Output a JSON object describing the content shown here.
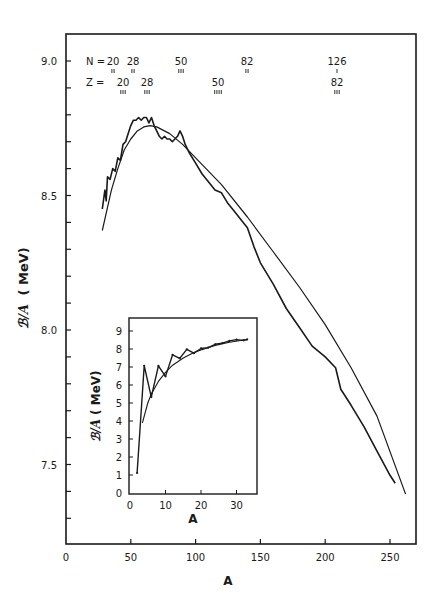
{
  "chart_data": [
    {
      "type": "line",
      "title": "",
      "xlabel": "A",
      "ylabel": "B/A (MeV)",
      "xlim": [
        0,
        270
      ],
      "ylim": [
        7.2,
        9.1
      ],
      "xticks": [
        0,
        50,
        100,
        150,
        200,
        250
      ],
      "yticks": [
        7.5,
        8.0,
        8.5,
        9.0
      ],
      "grid": false,
      "legend": null,
      "series": [
        {
          "name": "measured (jagged)",
          "x": [
            28,
            30,
            31,
            32,
            34,
            36,
            38,
            40,
            42,
            44,
            46,
            48,
            50,
            52,
            54,
            56,
            58,
            60,
            62,
            64,
            66,
            68,
            70,
            72,
            74,
            76,
            78,
            80,
            82,
            84,
            86,
            88,
            90,
            92,
            95,
            100,
            105,
            110,
            115,
            120,
            125,
            130,
            135,
            140,
            145,
            150,
            160,
            170,
            180,
            190,
            200,
            208,
            212,
            220,
            230,
            240,
            250,
            254
          ],
          "y": [
            8.45,
            8.52,
            8.48,
            8.57,
            8.56,
            8.6,
            8.59,
            8.64,
            8.63,
            8.69,
            8.7,
            8.73,
            8.76,
            8.78,
            8.78,
            8.79,
            8.78,
            8.79,
            8.79,
            8.77,
            8.79,
            8.76,
            8.74,
            8.72,
            8.71,
            8.72,
            8.71,
            8.71,
            8.7,
            8.71,
            8.72,
            8.74,
            8.72,
            8.69,
            8.66,
            8.62,
            8.58,
            8.55,
            8.52,
            8.51,
            8.47,
            8.44,
            8.41,
            8.38,
            8.31,
            8.25,
            8.17,
            8.08,
            8.01,
            7.94,
            7.9,
            7.86,
            7.78,
            7.72,
            7.64,
            7.55,
            7.46,
            7.43
          ]
        },
        {
          "name": "semi-empirical fit (smooth)",
          "x": [
            28,
            35,
            40,
            45,
            50,
            55,
            60,
            65,
            70,
            80,
            90,
            100,
            120,
            140,
            160,
            180,
            200,
            220,
            240,
            262
          ],
          "y": [
            8.37,
            8.52,
            8.6,
            8.67,
            8.71,
            8.74,
            8.755,
            8.76,
            8.755,
            8.73,
            8.69,
            8.64,
            8.54,
            8.42,
            8.29,
            8.16,
            8.02,
            7.86,
            7.68,
            7.39
          ]
        }
      ],
      "annotations": {
        "N_magic": [
          {
            "label": "20",
            "marks": "II",
            "A": 37
          },
          {
            "label": "28",
            "marks": "II",
            "A": 52
          },
          {
            "label": "50",
            "marks": "III",
            "A": 90
          },
          {
            "label": "82",
            "marks": "II",
            "A": 140
          },
          {
            "label": "126",
            "marks": "I",
            "A": 208
          }
        ],
        "Z_magic": [
          {
            "label": "20",
            "marks": "III",
            "A": 44
          },
          {
            "label": "28",
            "marks": "III",
            "A": 62
          },
          {
            "label": "50",
            "marks": "IIII",
            "A": 118
          },
          {
            "label": "82",
            "marks": "III",
            "A": 208
          }
        ]
      }
    },
    {
      "type": "line",
      "title": "inset: light nuclei",
      "xlabel": "A",
      "ylabel": "B/A (MeV)",
      "xlim": [
        0,
        36
      ],
      "ylim": [
        0,
        9.5
      ],
      "xticks": [
        0,
        10,
        20,
        30
      ],
      "yticks": [
        0,
        1,
        2,
        3,
        4,
        5,
        6,
        7,
        8,
        9
      ],
      "grid": false,
      "series": [
        {
          "name": "measured (jagged)",
          "x": [
            2,
            4,
            6,
            8,
            10,
            12,
            14,
            16,
            18,
            20,
            22,
            24,
            26,
            28,
            30,
            32,
            33
          ],
          "y": [
            1.11,
            7.07,
            5.33,
            7.06,
            6.48,
            7.68,
            7.48,
            7.98,
            7.77,
            8.03,
            8.08,
            8.26,
            8.33,
            8.45,
            8.52,
            8.48,
            8.53
          ]
        },
        {
          "name": "smooth fit",
          "x": [
            3.5,
            5,
            6,
            8,
            10,
            12,
            15,
            18,
            20,
            24,
            28,
            33
          ],
          "y": [
            3.9,
            5.0,
            5.5,
            6.2,
            6.7,
            7.1,
            7.5,
            7.8,
            7.95,
            8.2,
            8.38,
            8.53
          ]
        }
      ]
    }
  ],
  "labels": {
    "main_xlabel": "A",
    "main_ylabel_symbol": "ℬ/A",
    "main_ylabel_unit": "( MeV)",
    "inset_xlabel": "A",
    "inset_ylabel_symbol": "ℬ/A",
    "inset_ylabel_unit": "( MeV)",
    "N_prefix": "N  =",
    "Z_prefix": "Z  ="
  }
}
